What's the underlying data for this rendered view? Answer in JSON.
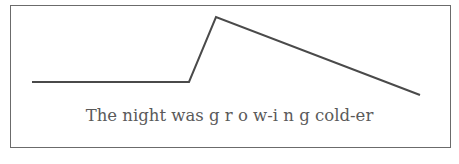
{
  "diagram": {
    "type": "intonation-contour",
    "caption": {
      "part1": "The night was ",
      "part2": "g r o w-i n g",
      "part3": " cold-er"
    },
    "contour_points": [
      [
        32,
        82
      ],
      [
        189,
        82
      ],
      [
        216,
        17
      ],
      [
        420,
        95
      ]
    ],
    "colors": {
      "line": "#4a4a4a",
      "frame": "#6b6b6b",
      "text": "#5a5a5a"
    }
  }
}
